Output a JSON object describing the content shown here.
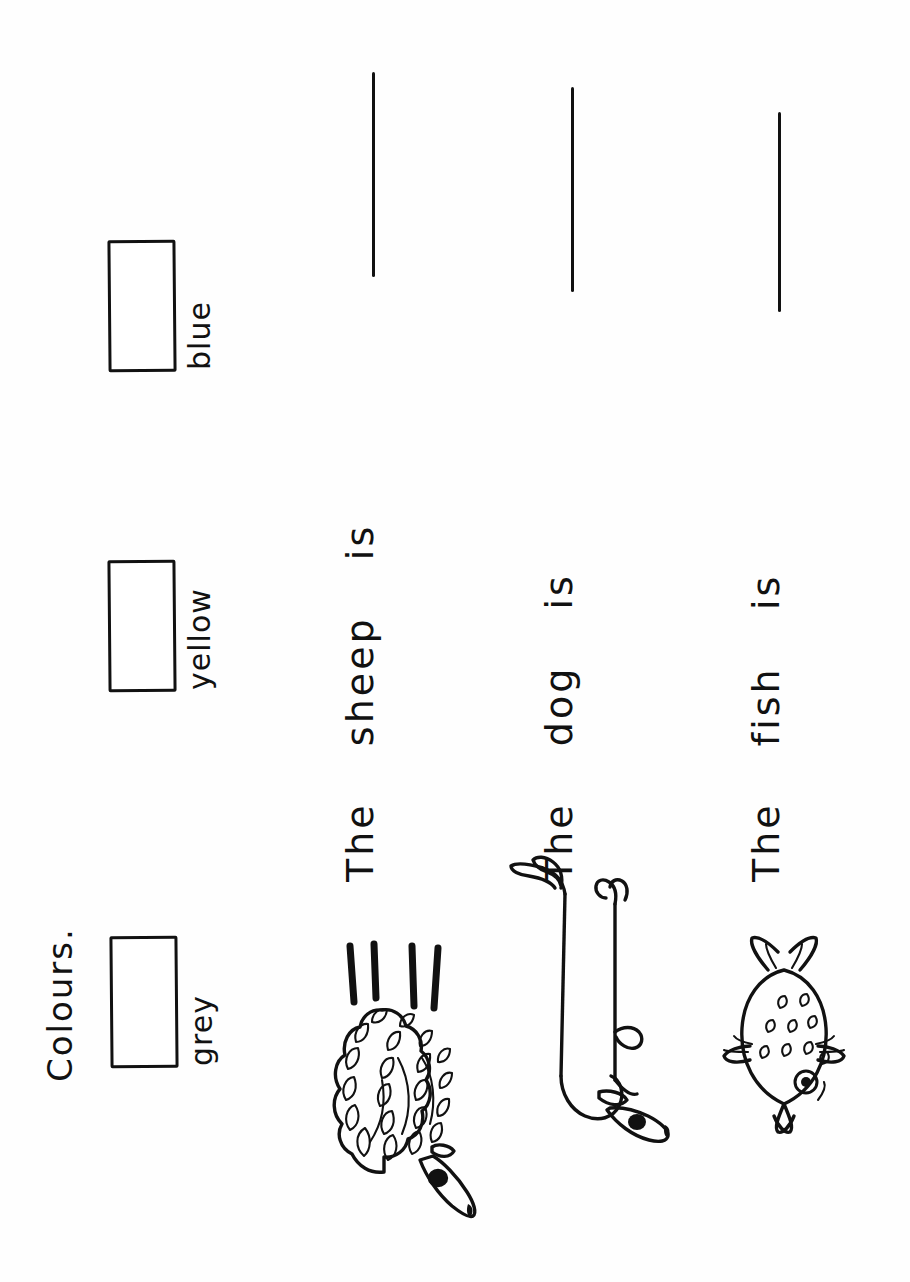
{
  "document": {
    "type": "worksheet",
    "title": "Colours.",
    "orientation": "landscape-scanned-rotated",
    "background_color": "#fefefe",
    "ink_color": "#111111"
  },
  "colour_key": {
    "items": [
      {
        "label": "grey",
        "box_fill": "#ffffff",
        "icon": "empty-colour-box"
      },
      {
        "label": "yellow",
        "box_fill": "#ffffff",
        "icon": "empty-colour-box"
      },
      {
        "label": "blue",
        "box_fill": "#ffffff",
        "icon": "empty-colour-box"
      }
    ]
  },
  "questions": [
    {
      "animal": "sheep",
      "figure_icon": "sheep-drawing",
      "sentence_start": "The",
      "subject": "sheep",
      "verb": "is",
      "answer": "",
      "answer_placeholder": ""
    },
    {
      "animal": "dog",
      "figure_icon": "dog-drawing",
      "sentence_start": "The",
      "subject": "dog",
      "verb": "is",
      "answer": "",
      "answer_placeholder": ""
    },
    {
      "animal": "fish",
      "figure_icon": "fish-drawing",
      "sentence_start": "The",
      "subject": "fish",
      "verb": "is",
      "answer": "",
      "answer_placeholder": ""
    }
  ]
}
